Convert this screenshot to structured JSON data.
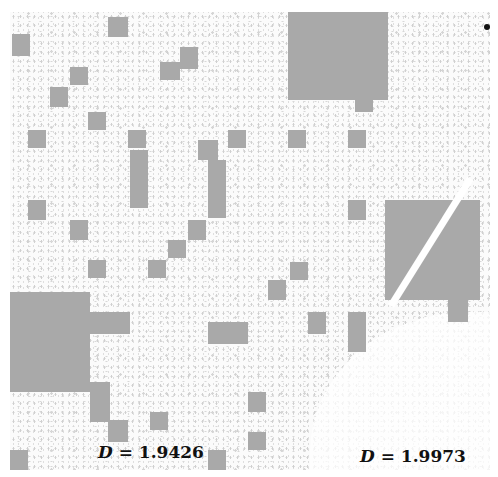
{
  "figure": {
    "top_caption": "",
    "labels": {
      "left": {
        "symbol": "D",
        "equals": "=",
        "value": "1.9426"
      },
      "right": {
        "symbol": "D",
        "equals": "=",
        "value": "1.9973"
      }
    },
    "block_color": "#a9a9a9",
    "background_color": "#fbfbfb",
    "blocks": [
      {
        "x": 278,
        "y": 0,
        "w": 100,
        "h": 88
      },
      {
        "x": 345,
        "y": 88,
        "w": 18,
        "h": 12
      },
      {
        "x": 2,
        "y": 22,
        "w": 18,
        "h": 22
      },
      {
        "x": 98,
        "y": 5,
        "w": 20,
        "h": 20
      },
      {
        "x": 170,
        "y": 35,
        "w": 18,
        "h": 22
      },
      {
        "x": 150,
        "y": 50,
        "w": 20,
        "h": 18
      },
      {
        "x": 60,
        "y": 55,
        "w": 18,
        "h": 18
      },
      {
        "x": 40,
        "y": 75,
        "w": 18,
        "h": 20
      },
      {
        "x": 78,
        "y": 100,
        "w": 18,
        "h": 18
      },
      {
        "x": 18,
        "y": 118,
        "w": 18,
        "h": 18
      },
      {
        "x": 118,
        "y": 118,
        "w": 18,
        "h": 18
      },
      {
        "x": 218,
        "y": 118,
        "w": 18,
        "h": 18
      },
      {
        "x": 120,
        "y": 138,
        "w": 18,
        "h": 58
      },
      {
        "x": 188,
        "y": 128,
        "w": 20,
        "h": 20
      },
      {
        "x": 198,
        "y": 148,
        "w": 18,
        "h": 58
      },
      {
        "x": 278,
        "y": 118,
        "w": 18,
        "h": 18
      },
      {
        "x": 338,
        "y": 118,
        "w": 18,
        "h": 18
      },
      {
        "x": 18,
        "y": 188,
        "w": 18,
        "h": 20
      },
      {
        "x": 60,
        "y": 208,
        "w": 18,
        "h": 20
      },
      {
        "x": 178,
        "y": 208,
        "w": 18,
        "h": 20
      },
      {
        "x": 158,
        "y": 228,
        "w": 18,
        "h": 18
      },
      {
        "x": 138,
        "y": 248,
        "w": 18,
        "h": 18
      },
      {
        "x": 78,
        "y": 248,
        "w": 18,
        "h": 18
      },
      {
        "x": 338,
        "y": 188,
        "w": 18,
        "h": 20
      },
      {
        "x": 280,
        "y": 250,
        "w": 18,
        "h": 18
      },
      {
        "x": 258,
        "y": 268,
        "w": 18,
        "h": 20
      },
      {
        "x": 0,
        "y": 280,
        "w": 80,
        "h": 100
      },
      {
        "x": 80,
        "y": 300,
        "w": 40,
        "h": 22
      },
      {
        "x": 80,
        "y": 370,
        "w": 20,
        "h": 40
      },
      {
        "x": 98,
        "y": 408,
        "w": 20,
        "h": 22
      },
      {
        "x": 198,
        "y": 310,
        "w": 40,
        "h": 22
      },
      {
        "x": 298,
        "y": 300,
        "w": 18,
        "h": 22
      },
      {
        "x": 338,
        "y": 300,
        "w": 18,
        "h": 40
      },
      {
        "x": 375,
        "y": 188,
        "w": 95,
        "h": 100
      },
      {
        "x": 438,
        "y": 288,
        "w": 20,
        "h": 22
      },
      {
        "x": 238,
        "y": 380,
        "w": 18,
        "h": 20
      },
      {
        "x": 238,
        "y": 420,
        "w": 18,
        "h": 18
      },
      {
        "x": 198,
        "y": 438,
        "w": 18,
        "h": 20
      },
      {
        "x": 0,
        "y": 438,
        "w": 18,
        "h": 20
      },
      {
        "x": 140,
        "y": 400,
        "w": 18,
        "h": 18
      }
    ],
    "stripe": {
      "x": 378,
      "y": 292,
      "length": 150,
      "angle": -58,
      "thickness": 7
    },
    "dot": {
      "x": 474,
      "y": 12
    }
  }
}
